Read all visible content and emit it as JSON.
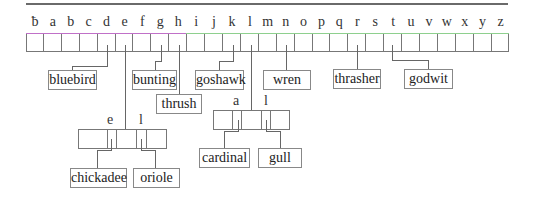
{
  "diagram": {
    "type": "trie",
    "root": {
      "letters": [
        "ƀ",
        "a",
        "b",
        "c",
        "d",
        "e",
        "f",
        "g",
        "h",
        "i",
        "j",
        "k",
        "l",
        "m",
        "n",
        "o",
        "p",
        "q",
        "r",
        "s",
        "t",
        "u",
        "v",
        "w",
        "x",
        "y",
        "z"
      ]
    },
    "leaves": [
      {
        "word": "bluebird",
        "from": "d"
      },
      {
        "word": "bunting",
        "from": "g"
      },
      {
        "word": "thrush",
        "from": "h"
      },
      {
        "word": "goshawk",
        "from": "k"
      },
      {
        "word": "wren",
        "from": "n"
      },
      {
        "word": "thrasher",
        "from": "r"
      },
      {
        "word": "godwit",
        "from": "t"
      }
    ],
    "subnode_c": {
      "from": "e",
      "letters": [
        "e",
        "l"
      ],
      "children": [
        {
          "word": "chickadee",
          "from": "e"
        },
        {
          "word": "oriole",
          "from": "l"
        }
      ]
    },
    "subnode_l": {
      "from": "l",
      "letters": [
        "a",
        "l"
      ],
      "children": [
        {
          "word": "cardinal",
          "from": "a"
        },
        {
          "word": "gull",
          "from": "l"
        }
      ]
    },
    "colors": {
      "line": "#666666",
      "pink_edge": "#c070c8",
      "green_edge": "#8ed08e"
    }
  }
}
